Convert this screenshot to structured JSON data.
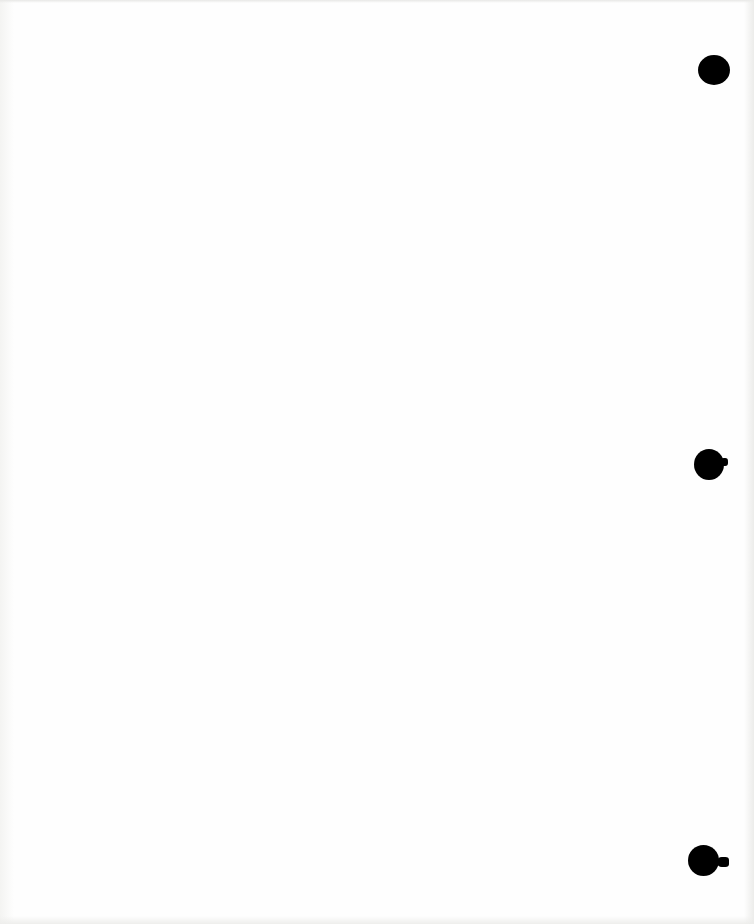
{
  "document": {
    "type": "blank-scanned-page",
    "punch_holes": [
      {
        "position": "top-right"
      },
      {
        "position": "middle-right"
      },
      {
        "position": "bottom-right"
      }
    ],
    "colors": {
      "paper": "#fefefe",
      "hole": "#000000"
    }
  }
}
